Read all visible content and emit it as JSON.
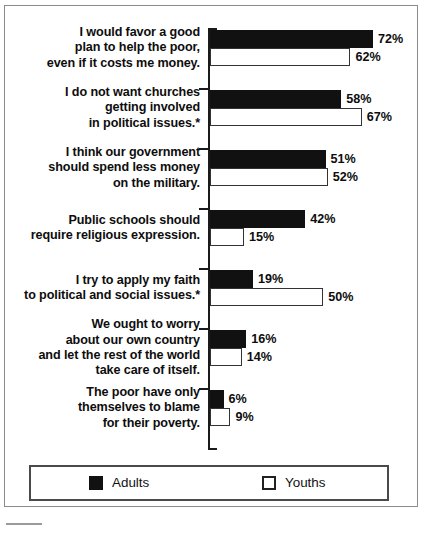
{
  "chart_data": {
    "type": "bar",
    "title": "",
    "subtitle": "",
    "xlabel": "",
    "ylabel": "",
    "orientation": "horizontal",
    "grid": false,
    "axis_range": [
      0,
      80
    ],
    "value_suffix": "%",
    "legend_position": "bottom",
    "footnote_marker": "*",
    "categories": [
      "I would favor a good\nplan to help the poor,\neven if it costs me money.",
      "I do not want churches\ngetting involved\nin political issues.*",
      "I think our government\nshould spend less money\non the military.",
      "Public schools should\nrequire religious expression.",
      "I try to apply my faith\nto political and social issues.*",
      "We ought to worry\nabout our own country\nand let the rest of the world\ntake care of itself.",
      "The poor have only\nthemselves to blame\nfor their poverty."
    ],
    "series": [
      {
        "name": "Adults",
        "color": "#111111",
        "values": [
          72,
          58,
          51,
          42,
          19,
          16,
          6
        ],
        "labels": [
          "72%",
          "58%",
          "51%",
          "42%",
          "19%",
          "16%",
          "6%"
        ]
      },
      {
        "name": "Youths",
        "color": "#ffffff",
        "values": [
          62,
          67,
          52,
          15,
          50,
          14,
          9
        ],
        "labels": [
          "62%",
          "67%",
          "52%",
          "15%",
          "50%",
          "14%",
          "9%"
        ]
      }
    ]
  },
  "legend": {
    "entries": [
      {
        "label": "Adults",
        "swatch": "filled-black-square"
      },
      {
        "label": "Youths",
        "swatch": "outlined-white-square"
      }
    ]
  }
}
